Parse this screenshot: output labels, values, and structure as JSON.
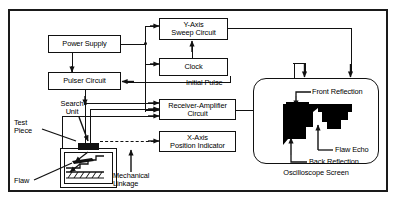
{
  "diagram": {
    "ink_color": "#111111",
    "background_color": "#ffffff",
    "trace_color": "#000000"
  },
  "blocks": {
    "power_supply": "Power Supply",
    "pulser_circuit": "Pulser Circuit",
    "y_axis_sweep": {
      "line1": "Y-Axis",
      "line2": "Sweep Circuit"
    },
    "clock": "Clock",
    "receiver_amplifier": {
      "line1": "Receiver-Amplifier",
      "line2": "Circuit"
    },
    "x_axis_position": {
      "line1": "X-Axis",
      "line2": "Position Indicator"
    }
  },
  "labels": {
    "initial_pulse": "Initial Pulse",
    "search_unit": {
      "line1": "Search",
      "line2": "Unit"
    },
    "test_piece": {
      "line1": "Test",
      "line2": "Piece"
    },
    "flaw": "Flaw",
    "mechanical_linkage": {
      "line1": "Mechanical",
      "line2": "Linkage"
    },
    "front_reflection": "Front Reflection",
    "flaw_echo": "Flaw Echo",
    "back_reflection": "Back Reflection",
    "oscilloscope_screen": "Oscilloscope Screen"
  }
}
